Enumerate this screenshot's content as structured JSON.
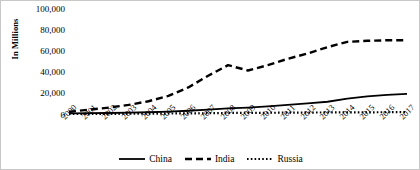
{
  "chart_data": {
    "type": "line",
    "title": "",
    "subtitle": "",
    "xlabel": "",
    "ylabel": "In Millions",
    "ylim": [
      0,
      100000
    ],
    "yticks": [
      0,
      20000,
      40000,
      60000,
      80000,
      100000
    ],
    "ytick_labels": [
      "0",
      "20,000",
      "40,000",
      "60,000",
      "80,000",
      "100,000"
    ],
    "grid": false,
    "legend_position": "bottom",
    "categories": [
      2000,
      2001,
      2002,
      2003,
      2004,
      2005,
      2006,
      2007,
      2008,
      2009,
      2010,
      2011,
      2012,
      2013,
      2014,
      2015,
      2016,
      2017
    ],
    "xtick_labels": [
      "2000",
      "2001",
      "2002",
      "2003",
      "2004",
      "2005",
      "2006",
      "2007",
      "2008",
      "2009",
      "2010",
      "2011",
      "2012",
      "2013",
      "2014",
      "2015",
      "2016",
      "2017"
    ],
    "series": [
      {
        "name": "China",
        "style": "solid",
        "color": "#000000",
        "values": [
          1500,
          1700,
          1900,
          2200,
          2600,
          3200,
          4000,
          5000,
          6200,
          7000,
          8200,
          9500,
          11000,
          12500,
          15500,
          17500,
          19000,
          20000
        ]
      },
      {
        "name": "India",
        "style": "dashed",
        "color": "#000000",
        "values": [
          3000,
          5000,
          7000,
          9500,
          13000,
          18000,
          26000,
          37000,
          47000,
          42000,
          47000,
          53000,
          58000,
          64000,
          69000,
          70000,
          70500,
          70500
        ]
      },
      {
        "name": "Russia",
        "style": "dotted",
        "color": "#000000",
        "values": [
          900,
          1000,
          1100,
          1200,
          1300,
          1400,
          1550,
          1700,
          1900,
          2000,
          2100,
          2200,
          2300,
          2400,
          2500,
          2550,
          2600,
          2700
        ]
      }
    ]
  },
  "legend": {
    "items": [
      {
        "label": "China",
        "style": "solid"
      },
      {
        "label": "India",
        "style": "dashed"
      },
      {
        "label": "Russia",
        "style": "dotted"
      }
    ]
  }
}
